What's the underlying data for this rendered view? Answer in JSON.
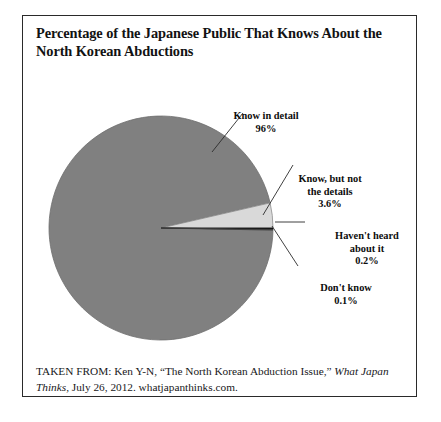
{
  "figure": {
    "title": "Percentage of the Japanese Public That Knows About the North Korean Abductions",
    "title_line_1": "Percentage of the Japanese Public That Knows About",
    "title_line_2": "the North Korean Abductions",
    "frame_color": "#2a2a2a",
    "background_color": "#ffffff"
  },
  "chart_data": {
    "type": "pie",
    "title": "Percentage of the Japanese Public That Knows About the North Korean Abductions",
    "categories": [
      "Know in detail",
      "Know, but not the details",
      "Haven't heard about it",
      "Don't know"
    ],
    "values": [
      96,
      3.6,
      0.2,
      0.1
    ],
    "value_labels": [
      "96%",
      "3.6%",
      "0.2%",
      "0.1%"
    ],
    "colors": [
      "#808080",
      "#d9d9d9",
      "#111111",
      "#4a4a4a"
    ],
    "unit": "percent",
    "legend": "none",
    "labels_position": "outside-with-leader-lines",
    "grid": false,
    "start_angle_deg": 0,
    "direction": "counterclockwise",
    "slices": [
      {
        "label": "Know in detail",
        "value": 96,
        "value_label": "96%",
        "color": "#808080"
      },
      {
        "label": "Know, but not the details",
        "value": 3.6,
        "value_label": "3.6%",
        "color": "#d9d9d9"
      },
      {
        "label": "Haven't heard about it",
        "value": 0.2,
        "value_label": "0.2%",
        "color": "#111111"
      },
      {
        "label": "Don't know",
        "value": 0.1,
        "value_label": "0.1%",
        "color": "#4a4a4a"
      }
    ]
  },
  "labels": {
    "know_in_detail": {
      "line_1": "Know in detail",
      "pct": "96%"
    },
    "know_not_details": {
      "line_1": "Know, but not",
      "line_2": "the details",
      "pct": "3.6%"
    },
    "havent_heard": {
      "line_1": "Haven't heard",
      "line_2": "about it",
      "pct": "0.2%"
    },
    "dont_know": {
      "line_1": "Don't know",
      "pct": "0.1%"
    }
  },
  "citation": {
    "prefix": "TAKEN FROM: Ken Y-N, “The North Korean Abduction Issue,”",
    "publication": "What Japan Thinks,",
    "suffix": " July 26, 2012. whatjapanthinks.com."
  }
}
